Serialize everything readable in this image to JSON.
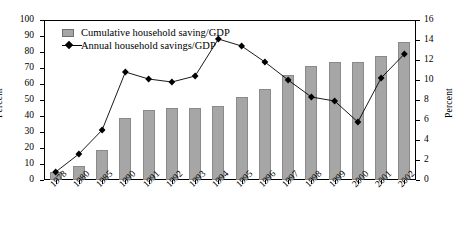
{
  "chart_data": {
    "type": "bar",
    "title": "",
    "subtitle": "",
    "xlabel": "",
    "ylabel": "Percent",
    "y2label": "Percent",
    "ylim": [
      0,
      100
    ],
    "y2lim": [
      0,
      16
    ],
    "yticks": [
      0,
      10,
      20,
      30,
      40,
      50,
      60,
      70,
      80,
      90,
      100
    ],
    "y2ticks": [
      0,
      2,
      4,
      6,
      8,
      10,
      12,
      14,
      16
    ],
    "grid": false,
    "legend_position": "top-left",
    "categories": [
      "1978",
      "1980",
      "1985",
      "1990",
      "1991",
      "1992",
      "1993",
      "1994",
      "1995",
      "1996",
      "1997",
      "1998",
      "1999",
      "2000",
      "2001",
      "2002"
    ],
    "series": [
      {
        "name": "Cumulative household saving/GDP",
        "type": "bar",
        "axis": "left",
        "color": "#a6a6a6",
        "values": [
          5,
          9,
          18.5,
          39,
          44,
          45,
          45,
          46.5,
          52,
          57,
          65.5,
          71,
          73.5,
          73.5,
          77.5,
          86
        ]
      },
      {
        "name": "Annual household savings/GDP",
        "type": "line",
        "axis": "right",
        "color": "#000000",
        "marker": "diamond",
        "values": [
          0.8,
          2.6,
          5.0,
          10.8,
          10.1,
          9.8,
          10.4,
          14.1,
          13.4,
          11.8,
          10.0,
          8.3,
          7.9,
          5.8,
          10.2,
          12.6
        ]
      }
    ]
  },
  "legend": {
    "items": [
      {
        "label": "Cumulative household saving/GDP",
        "marker": "swatch"
      },
      {
        "label": "Annual household savings/GDP",
        "marker": "line-diamond"
      }
    ]
  },
  "axes": {
    "left_title": "Percent",
    "right_title": "Percent"
  }
}
